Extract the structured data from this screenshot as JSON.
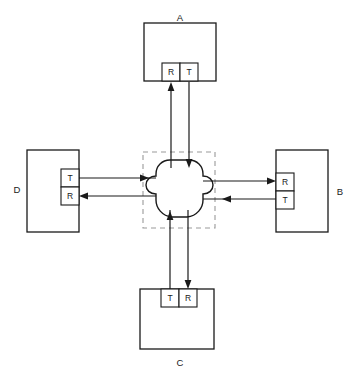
{
  "figure": {
    "type": "network-topology-diagram",
    "title": "",
    "caption": "",
    "background_color": "#ffffff",
    "line_color": "#1a1a1a",
    "dashed_color": "#9a9a9a"
  },
  "center": {
    "name": "central-cloud",
    "shape": "cloud",
    "label": "",
    "boundary": "dashed-square"
  },
  "nodes": [
    {
      "id": "A",
      "label": "A",
      "position": "top",
      "label_position": "above",
      "ports": [
        {
          "label": "R",
          "role": "receive",
          "order": 0
        },
        {
          "label": "T",
          "role": "transmit",
          "order": 1
        }
      ]
    },
    {
      "id": "B",
      "label": "B",
      "position": "right",
      "label_position": "right",
      "ports": [
        {
          "label": "R",
          "role": "receive",
          "order": 0
        },
        {
          "label": "T",
          "role": "transmit",
          "order": 1
        }
      ]
    },
    {
      "id": "C",
      "label": "C",
      "position": "bottom",
      "label_position": "below",
      "ports": [
        {
          "label": "T",
          "role": "transmit",
          "order": 0
        },
        {
          "label": "R",
          "role": "receive",
          "order": 1
        }
      ]
    },
    {
      "id": "D",
      "label": "D",
      "position": "left",
      "label_position": "left",
      "ports": [
        {
          "label": "T",
          "role": "transmit",
          "order": 0
        },
        {
          "label": "R",
          "role": "receive",
          "order": 1
        }
      ]
    }
  ],
  "links": [
    {
      "from": "center",
      "to": "A.R",
      "direction": "up"
    },
    {
      "from": "A.T",
      "to": "center",
      "direction": "down"
    },
    {
      "from": "center",
      "to": "B.R",
      "direction": "right"
    },
    {
      "from": "B.T",
      "to": "center",
      "direction": "left"
    },
    {
      "from": "C.T",
      "to": "center",
      "direction": "up"
    },
    {
      "from": "center",
      "to": "C.R",
      "direction": "down"
    },
    {
      "from": "D.T",
      "to": "center",
      "direction": "right"
    },
    {
      "from": "center",
      "to": "D.R",
      "direction": "left"
    }
  ]
}
